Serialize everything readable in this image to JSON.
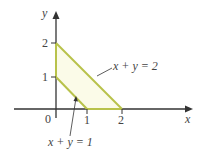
{
  "figure": {
    "axes": {
      "x_label": "x",
      "y_label": "y"
    },
    "ticks": {
      "x": [
        {
          "label": "0"
        },
        {
          "label": "1"
        },
        {
          "label": "2"
        }
      ],
      "y": [
        {
          "label": "1"
        },
        {
          "label": "2"
        }
      ]
    },
    "annotations": [
      {
        "id": "outer_line",
        "text": "x + y = 2"
      },
      {
        "id": "inner_line",
        "text": "x + y = 1"
      }
    ],
    "colors": {
      "boundary": "#b8c24a",
      "fill": "#fbfbe8",
      "axis": "#333333"
    }
  }
}
